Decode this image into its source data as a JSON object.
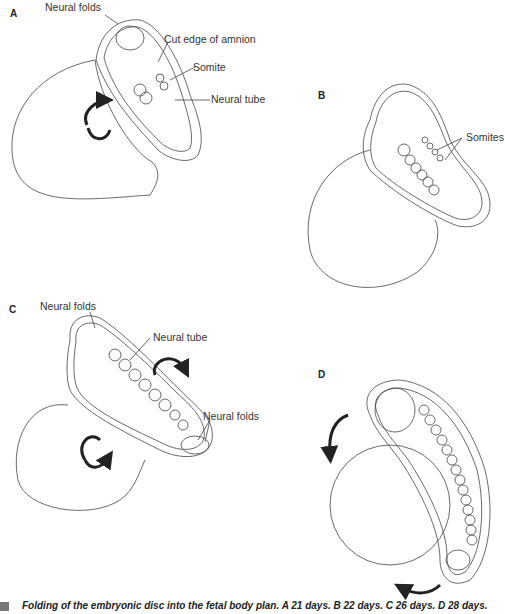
{
  "figure": {
    "panels": [
      {
        "letter": "A",
        "labels": [
          "Neural folds",
          "Cut edge of amnion",
          "Somite",
          "Neural tube"
        ]
      },
      {
        "letter": "B",
        "labels": [
          "Somites"
        ]
      },
      {
        "letter": "C",
        "labels": [
          "Neural folds",
          "Neural tube",
          "Neural folds"
        ]
      },
      {
        "letter": "D",
        "labels": []
      }
    ],
    "caption": "Folding of the embryonic disc into the fetal body plan.  A 21 days.  B 22 days.  C 26 days.  D 28 days."
  }
}
